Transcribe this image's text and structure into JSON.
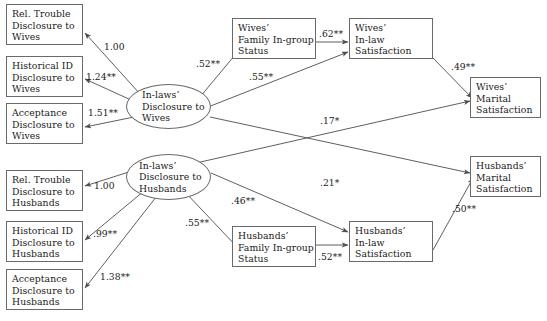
{
  "diagram": {
    "type": "sem-path-diagram",
    "title": "",
    "arrow_color": "#4d4d4d",
    "box_border_color": "#6a6a6a",
    "text_color": "#1a1a1a",
    "background": "#ffffff",
    "observed_nodes": [
      {
        "id": "rel-trouble-wives",
        "lines": [
          "Rel. Trouble",
          "Disclosure to",
          "Wives"
        ]
      },
      {
        "id": "historical-id-wives",
        "lines": [
          "Historical ID",
          "Disclosure to",
          "Wives"
        ]
      },
      {
        "id": "acceptance-wives",
        "lines": [
          "Acceptance",
          "Disclosure to",
          "Wives"
        ]
      },
      {
        "id": "rel-trouble-husbands",
        "lines": [
          "Rel. Trouble",
          "Disclosure to",
          "Husbands"
        ]
      },
      {
        "id": "historical-id-husbands",
        "lines": [
          "Historical ID",
          "Disclosure to",
          "Husbands"
        ]
      },
      {
        "id": "acceptance-husbands",
        "lines": [
          "Acceptance",
          "Disclosure to",
          "Husbands"
        ]
      },
      {
        "id": "wives-family-ingroup",
        "lines": [
          "Wives’",
          "Family In-group",
          "Status"
        ]
      },
      {
        "id": "wives-inlaw-satisfaction",
        "lines": [
          "Wives’",
          "In-law",
          "Satisfaction"
        ]
      },
      {
        "id": "wives-marital",
        "lines": [
          "Wives’",
          "Marital",
          "Satisfaction"
        ]
      },
      {
        "id": "husbands-family-ingroup",
        "lines": [
          "Husbands’",
          "Family In-group",
          "Status"
        ]
      },
      {
        "id": "husbands-inlaw-satisfaction",
        "lines": [
          "Husbands’",
          "In-law",
          "Satisfaction"
        ]
      },
      {
        "id": "husbands-marital",
        "lines": [
          "Husbands’",
          "Marital",
          "Satisfaction"
        ]
      }
    ],
    "latent_nodes": [
      {
        "id": "inlaws-disclosure-wives",
        "lines": [
          "In-laws’",
          "Disclosure to",
          "Wives"
        ]
      },
      {
        "id": "inlaws-disclosure-husbands",
        "lines": [
          "In-laws’",
          "Disclosure to",
          "Husbands"
        ]
      }
    ],
    "paths": [
      {
        "id": "p-wives-reltrouble",
        "from": "inlaws-disclosure-wives",
        "to": "rel-trouble-wives",
        "coefficient": "1.00"
      },
      {
        "id": "p-wives-histid",
        "from": "inlaws-disclosure-wives",
        "to": "historical-id-wives",
        "coefficient": "1.24**"
      },
      {
        "id": "p-wives-acceptance",
        "from": "inlaws-disclosure-wives",
        "to": "acceptance-wives",
        "coefficient": "1.51**"
      },
      {
        "id": "p-wives-ingroup",
        "from": "inlaws-disclosure-wives",
        "to": "wives-family-ingroup",
        "coefficient": ".52**"
      },
      {
        "id": "p-wives-inlawsat",
        "from": "inlaws-disclosure-wives",
        "to": "wives-inlaw-satisfaction",
        "coefficient": ".55**"
      },
      {
        "id": "p-wingroup-inlawsat",
        "from": "wives-family-ingroup",
        "to": "wives-inlaw-satisfaction",
        "coefficient": ".62**"
      },
      {
        "id": "p-winlaw-marital",
        "from": "wives-inlaw-satisfaction",
        "to": "wives-marital",
        "coefficient": ".49**"
      },
      {
        "id": "p-husbdisc-wmarital",
        "from": "inlaws-disclosure-husbands",
        "to": "wives-marital",
        "coefficient": ".17*"
      },
      {
        "id": "p-husb-reltrouble",
        "from": "inlaws-disclosure-husbands",
        "to": "rel-trouble-husbands",
        "coefficient": "1.00"
      },
      {
        "id": "p-husb-histid",
        "from": "inlaws-disclosure-husbands",
        "to": "historical-id-husbands",
        "coefficient": ".99**"
      },
      {
        "id": "p-husb-acceptance",
        "from": "inlaws-disclosure-husbands",
        "to": "acceptance-husbands",
        "coefficient": "1.38**"
      },
      {
        "id": "p-husb-ingroup",
        "from": "inlaws-disclosure-husbands",
        "to": "husbands-family-ingroup",
        "coefficient": ".55**"
      },
      {
        "id": "p-husb-inlawsat",
        "from": "inlaws-disclosure-husbands",
        "to": "husbands-inlaw-satisfaction",
        "coefficient": ".46**"
      },
      {
        "id": "p-wivesdisc-hmarital",
        "from": "inlaws-disclosure-wives",
        "to": "husbands-marital",
        "coefficient": ".21*"
      },
      {
        "id": "p-hingroup-inlawsat",
        "from": "husbands-family-ingroup",
        "to": "husbands-inlaw-satisfaction",
        "coefficient": ".52**"
      },
      {
        "id": "p-hinlaw-marital",
        "from": "husbands-inlaw-satisfaction",
        "to": "husbands-marital",
        "coefficient": ".50**"
      }
    ]
  }
}
